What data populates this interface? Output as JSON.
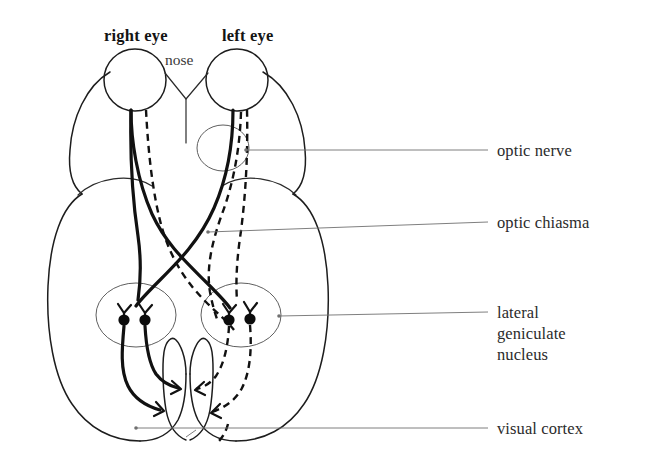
{
  "figure": {
    "title": "Visual pathway from the eyes to the visual cortex",
    "background_color": "#ffffff",
    "ink_color": "#111111",
    "leader_color": "#707070",
    "width": 650,
    "height": 466
  },
  "top_labels": {
    "right_eye": "right eye",
    "left_eye": "left eye",
    "nose": "nose"
  },
  "callouts": [
    {
      "id": "optic-nerve",
      "label": "optic nerve"
    },
    {
      "id": "optic-chiasma",
      "label": "optic chiasma"
    },
    {
      "id": "lateral-geniculate-nucleus",
      "label_line_1": "lateral",
      "label_line_2": "geniculate",
      "label_line_3": "nucleus"
    },
    {
      "id": "visual-cortex",
      "label": "visual cortex"
    }
  ],
  "structures": {
    "right_eye_ball": "right-eyeball",
    "left_eye_ball": "left-eyeball",
    "nose_marker": "nose-marker",
    "brain_outline": "brain-outline",
    "optic_nerve_ring": "optic-nerve-ring",
    "left_lgn_ring": "left-lgn-ring",
    "right_lgn_ring": "right-lgn-ring",
    "chiasma_crossing": "optic-chiasma-crossing",
    "occipital_notch": "occipital-notch"
  },
  "pathways": {
    "solid_line_meaning": "right visual field fibres",
    "dashed_line_meaning": "left visual field fibres",
    "synapse_count": 4
  }
}
